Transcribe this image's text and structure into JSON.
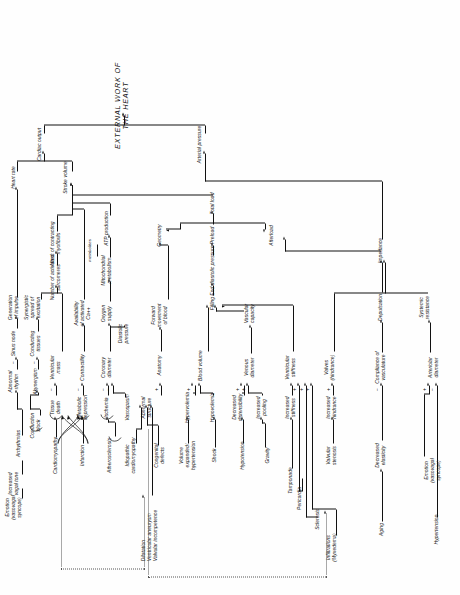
{
  "figure": {
    "type": "flowchart",
    "orientation": "rotated-90-ccw",
    "title": "EXTERNAL WORK OF THE HEART"
  },
  "nodes": {
    "emotion_vasovagal_top": "Emotion\n(vasovagal\nsyncope)",
    "hypertension_top": "Hypertension",
    "arteriolar_diameter": "Arteriolar\ndiameter",
    "systemic_resistance": "Systemic\nresistance",
    "aging": "Aging",
    "decreased_elasticity": "Decreased\nelasticity",
    "compliance_vasculature": "Compliance of\nvasculature",
    "depulsation": "Depulsation",
    "impedance": "Impedance",
    "infiltrations": "Infiltrations\n(Myxedema)",
    "sclerosis": "Sclerosis",
    "valvular_stenosis": "Valvular\nstenosis",
    "increased_hindrance": "Increased\nhindrance",
    "valves_hindrance": "Valves\n(hindrance)",
    "pericardia": "Pericardia",
    "tamponade": "Tamponade",
    "increased_stiffness": "Increased\nstiffness",
    "ventricular_stiffness": "Ventricular\nstiffness",
    "gravity": "Gravity",
    "increased_pooling": "Increased\npooling",
    "hypotension": "Hypotension",
    "decreased_distensibility": "Decreased\ndistensibility",
    "venous_diameter": "Venous\ndiameter",
    "vascular_capacity": "Vascular\ncapacity",
    "shock": "Shock",
    "hypovolemia": "Hypovolemia",
    "volume_expanded": "Volume\nexpanded/\nhypertension",
    "hypervolemia": "Hypervolemia",
    "blood_volume": "Blood volume",
    "filling": "Filling",
    "end_diastolic_pressure": "End diastolic  pressure",
    "preload": "Preload",
    "afterload": "Afterload",
    "total_load": "Total load",
    "dilatation": "Dilatation\nVentricular aneurysm\nValvular incompetence",
    "congenital_defects": "Congenital\ndefects",
    "idiopathic_cardiomyopathy": "Idiopathic\ncardiomyopathy",
    "abnormal_structure": "Abnormal\nstructure",
    "anatomy": "Anatomy",
    "forward_movement": "Forward\nmovement\nof  blood",
    "geometry": "Geometry",
    "atherosclerosis": "Atherosclerosis",
    "vasospasm": "Vasospasm",
    "ischemia": "Ischemia",
    "coronary_diameter": "Coronary\ndiameter",
    "diastolic_pressure": "Diastolic\npressure",
    "oxygen_supply": "Oxygen\nsupply",
    "mitochondrial_metabolism": "Mitochondrial\nmetabolism",
    "metabolites": "metabolites",
    "atp_production": "ATP production",
    "infarction": "Infarction",
    "metabolic_depression": "Metabolic\ndepression",
    "contractility": "Contractility",
    "availability_ca": "Availability\nof activated\nCa++",
    "cardiomyopathy": "Cardiomyopathy",
    "tissue_death": "Tissue\ndeath",
    "ventricular_mass": "Ventricular\nmass",
    "num_activated_sarcomeres": "Number of activated\nsarcomeres",
    "mass_contracting_myofibrils": "Mass of  contracting\nmyofibrils",
    "conduction_block": "Conduction\nblock",
    "akynergism": "Akynergism",
    "conducting_tissues": "Conducting\ntissues",
    "synergistic_spread": "Synergistic\nspread of\nexcitation",
    "arrhythmias": "Arrhythmias",
    "sinus_node": "Sinus  node",
    "abnormal_rhythm": "Abnormal\nrhythm",
    "generation_of_impulse": "Generation\nof  impulse",
    "emotion_vasovagal_bottom": "Emotion\n(vasovagal\nsyncope)",
    "increased_vagal_tone": "Increased\nvagal tone",
    "stroke_volume": "Stroke volume",
    "heart_rate": "Heart rate",
    "cardiac_output": "Cardiac output",
    "arterial_pressure": "Arterial pressure",
    "external_work": "EXTERNAL  WORK  OF  THE  HEART"
  },
  "signs": {
    "plus": "+",
    "minus": "−"
  },
  "colors": {
    "ink": "#111111",
    "dotted": "#555555",
    "background": "#fefefe"
  }
}
